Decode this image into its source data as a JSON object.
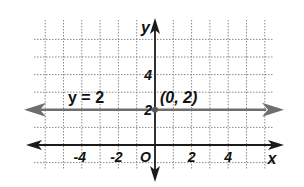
{
  "chart_data": {
    "type": "line",
    "title": "",
    "xlabel": "x",
    "ylabel": "y",
    "xlim": [
      -7,
      7
    ],
    "ylim": [
      -1,
      6
    ],
    "grid": true,
    "x_ticks": [
      -6,
      -5,
      -4,
      -3,
      -2,
      -1,
      1,
      2,
      3,
      4,
      5,
      6
    ],
    "y_ticks": [
      -1,
      1,
      2,
      3,
      4,
      5,
      6
    ],
    "x_tick_labels": [
      {
        "value": -4,
        "label": "-4"
      },
      {
        "value": -2,
        "label": "-2"
      },
      {
        "value": 2,
        "label": "2"
      },
      {
        "value": 4,
        "label": "4"
      }
    ],
    "y_tick_labels": [
      {
        "value": 2,
        "label": "2"
      },
      {
        "value": 4,
        "label": "4"
      }
    ],
    "origin_label": "O",
    "series": [
      {
        "name": "y = 2",
        "equation": "y = 2",
        "x": [
          -7,
          7
        ],
        "y": [
          2,
          2
        ],
        "color": "#6e6e6e",
        "arrows": "both"
      }
    ],
    "annotations": [
      {
        "text": "y = 2",
        "x": -4.5,
        "y": 2.5
      },
      {
        "text": "(0, 2)",
        "x": 0.3,
        "y": 2.5
      }
    ],
    "points": [
      {
        "x": 0,
        "y": 2,
        "label": "(0, 2)"
      }
    ]
  },
  "colors": {
    "axis": "#1a1a1a",
    "line": "#6e6e6e",
    "grid": "#8a8a8a"
  }
}
